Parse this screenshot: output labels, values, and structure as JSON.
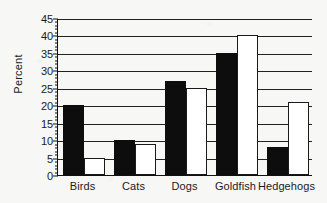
{
  "chart_data": {
    "type": "bar",
    "title": "",
    "xlabel": "",
    "ylabel": "Percent",
    "ylim": [
      0,
      45
    ],
    "ytick_step": 5,
    "yticks": [
      0,
      5,
      10,
      15,
      20,
      25,
      30,
      35,
      40,
      45
    ],
    "ytick_labels": [
      "0",
      "5",
      "10",
      "15",
      "20",
      "25",
      "30",
      "35",
      "40",
      "45"
    ],
    "minor_tick_step": 1,
    "grid": true,
    "grid_axis": "y",
    "legend": false,
    "legend_position": "none",
    "categories": [
      "Birds",
      "Cats",
      "Dogs",
      "Goldfish",
      "Hedgehogs"
    ],
    "series": [
      {
        "name": "series-filled",
        "style": "filled-black",
        "color": "#0d0d0d",
        "values": [
          20,
          10,
          27,
          35,
          8
        ]
      },
      {
        "name": "series-hollow",
        "style": "hollow-white",
        "color": "#ffffff",
        "edge_color": "#1a1a1a",
        "values": [
          5,
          9,
          25,
          40,
          21
        ]
      }
    ]
  },
  "colors": {
    "background": "#f7f7f5",
    "axis": "#111111",
    "gridline": "#222222",
    "text": "#1a1a1a",
    "bar_filled": "#0d0d0d",
    "bar_hollow_fill": "#ffffff",
    "bar_hollow_edge": "#1a1a1a"
  }
}
